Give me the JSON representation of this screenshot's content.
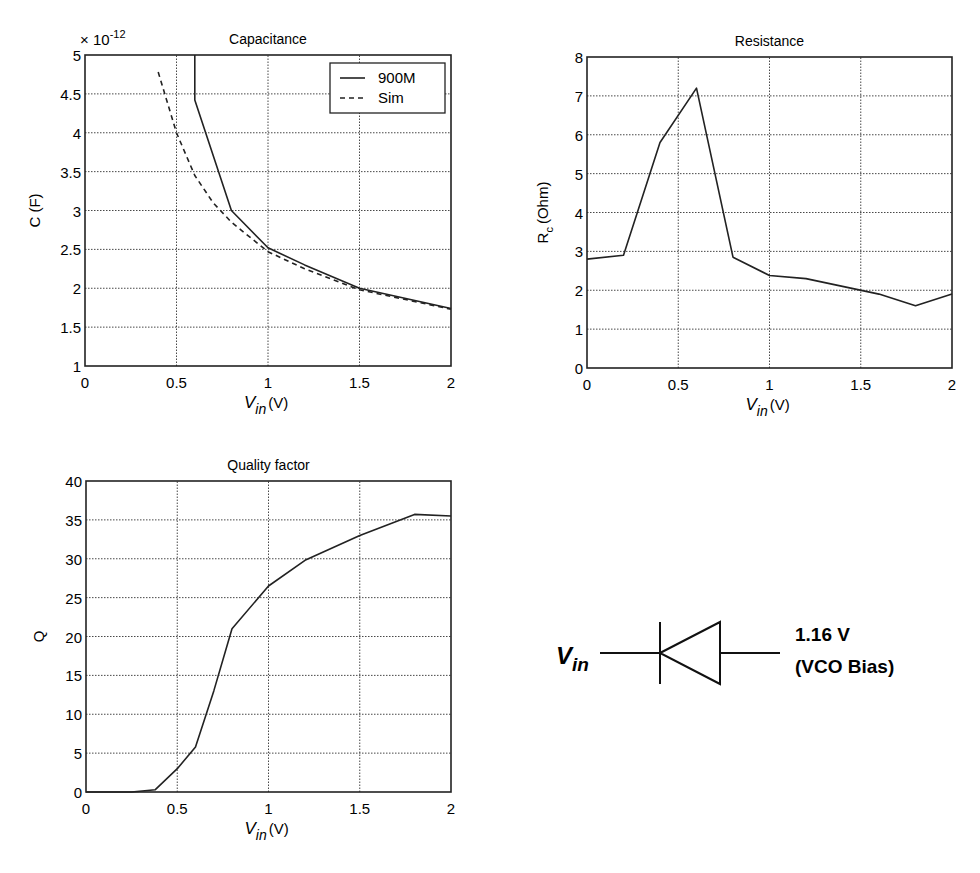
{
  "chart_data": [
    {
      "type": "line",
      "title": "Capacitance",
      "xlabel": "V_in (V)",
      "ylabel": "C (F)",
      "y_multiplier": "× 10^-12",
      "xlim": [
        0,
        2
      ],
      "ylim": [
        1,
        5
      ],
      "xticks": [
        "0",
        "0.5",
        "1",
        "1.5",
        "2"
      ],
      "yticks": [
        "1",
        "1.5",
        "2",
        "2.5",
        "3",
        "3.5",
        "4",
        "4.5",
        "5"
      ],
      "grid": true,
      "legend_position": "upper right",
      "series": [
        {
          "name": "900M",
          "style": "solid",
          "x": [
            0.6,
            0.6,
            0.8,
            1.0,
            1.2,
            1.5,
            2.0
          ],
          "y": [
            5.0,
            4.42,
            3.0,
            2.52,
            2.3,
            2.0,
            1.74
          ]
        },
        {
          "name": "Sim",
          "style": "dashed",
          "x": [
            0.4,
            0.5,
            0.6,
            0.7,
            0.8,
            1.0,
            1.2,
            1.5,
            2.0
          ],
          "y": [
            4.78,
            4.0,
            3.45,
            3.1,
            2.85,
            2.47,
            2.25,
            1.98,
            1.73
          ]
        }
      ]
    },
    {
      "type": "line",
      "title": "Resistance",
      "xlabel": "V_in (V)",
      "ylabel": "R_c (Ohm)",
      "xlim": [
        0,
        2
      ],
      "ylim": [
        0,
        8
      ],
      "xticks": [
        "0",
        "0.5",
        "1",
        "1.5",
        "2"
      ],
      "yticks": [
        "0",
        "1",
        "2",
        "3",
        "4",
        "5",
        "6",
        "7",
        "8"
      ],
      "grid": true,
      "series": [
        {
          "name": "Rc",
          "x": [
            0,
            0.2,
            0.4,
            0.6,
            0.8,
            1.0,
            1.2,
            1.4,
            1.6,
            1.8,
            2.0
          ],
          "y": [
            2.8,
            2.9,
            5.8,
            7.2,
            2.85,
            2.38,
            2.3,
            2.1,
            1.9,
            1.6,
            1.9
          ]
        }
      ]
    },
    {
      "type": "line",
      "title": "Quality factor",
      "xlabel": "V_in (V)",
      "ylabel": "Q",
      "xlim": [
        0,
        2
      ],
      "ylim": [
        0,
        40
      ],
      "xticks": [
        "0",
        "0.5",
        "1",
        "1.5",
        "2"
      ],
      "yticks": [
        "0",
        "5",
        "10",
        "15",
        "20",
        "25",
        "30",
        "35",
        "40"
      ],
      "grid": true,
      "series": [
        {
          "name": "Q",
          "x": [
            0,
            0.25,
            0.38,
            0.5,
            0.6,
            0.7,
            0.8,
            1.0,
            1.2,
            1.5,
            1.8,
            2.0
          ],
          "y": [
            0,
            0,
            0.3,
            3,
            5.8,
            13,
            21,
            26.5,
            29.8,
            33,
            35.7,
            35.5
          ]
        }
      ]
    }
  ],
  "schematic": {
    "input_label_main": "V",
    "input_label_sub": "in",
    "bias_value": "1.16 V",
    "bias_note": "(VCO Bias)",
    "component": "varactor-diode"
  }
}
